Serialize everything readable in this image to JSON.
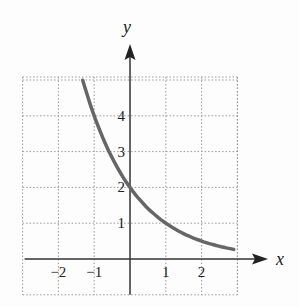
{
  "chart_data": {
    "type": "line",
    "title": "",
    "xlabel": "x",
    "ylabel": "y",
    "function": "y = 2(1/2)^x",
    "xlim": [
      -3,
      3
    ],
    "ylim": [
      -1,
      5
    ],
    "grid": true,
    "grid_style": "dotted",
    "x_ticks": [
      {
        "value": -2,
        "label": "−2"
      },
      {
        "value": -1,
        "label": "−1"
      },
      {
        "value": 1,
        "label": "1"
      },
      {
        "value": 2,
        "label": "2"
      }
    ],
    "y_ticks": [
      {
        "value": 1,
        "label": "1"
      },
      {
        "value": 2,
        "label": "2"
      },
      {
        "value": 3,
        "label": "3"
      },
      {
        "value": 4,
        "label": "4"
      }
    ],
    "series": [
      {
        "name": "curve",
        "color": "#666666",
        "x": [
          -1.32,
          -1,
          -0.5,
          0,
          0.5,
          1,
          1.5,
          2,
          2.5,
          2.9
        ],
        "y": [
          4.99,
          4,
          2.83,
          2,
          1.41,
          1,
          0.71,
          0.5,
          0.35,
          0.27
        ]
      }
    ],
    "legend": null
  },
  "labels": {
    "x_axis": "x",
    "y_axis": "y"
  }
}
